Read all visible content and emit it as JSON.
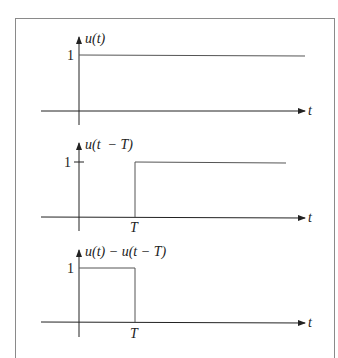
{
  "diagram": {
    "panels": [
      {
        "id": "unit-step",
        "ylabel": "u(t)",
        "xlabel": "t",
        "level_label": "1",
        "marker_label": ""
      },
      {
        "id": "shifted-step",
        "ylabel": "u(t  − T)",
        "xlabel": "t",
        "level_label": "1",
        "marker_label": "T"
      },
      {
        "id": "rectangular-pulse",
        "ylabel": "u(t) − u(t − T)",
        "xlabel": "t",
        "level_label": "1",
        "marker_label": "T"
      }
    ],
    "colors": {
      "axis": "#222222",
      "signal": "#555555",
      "frame": "#8a8a8a"
    }
  }
}
